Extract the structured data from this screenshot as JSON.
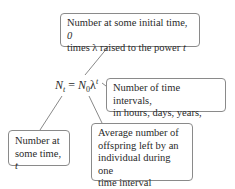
{
  "diagram": {
    "equation": {
      "lhs_var": "N",
      "lhs_sub": "t",
      "equals": "=",
      "rhs_var": "N",
      "rhs_sub": "0",
      "lambda": "λ",
      "exponent": "t"
    },
    "callouts": [
      {
        "id": "initial-number",
        "line1_pre": "Number at some initial time, ",
        "line1_italic": "0",
        "line2_pre": "times λ raised to the power ",
        "line2_italic": "t"
      },
      {
        "id": "time-intervals",
        "line1": "Number of time intervals,",
        "line2": "in hours, days, years, etc."
      },
      {
        "id": "number-at-time-t",
        "line1": "Number at",
        "line2_pre": "some time, ",
        "line2_italic": "t"
      },
      {
        "id": "average-offspring",
        "line1": "Average number of",
        "line2": "offspring left by an",
        "line3": "individual during one",
        "line4": "time interval"
      }
    ],
    "colors": {
      "border": "#8a8a8a",
      "line": "#6a6a6a",
      "text": "#2a2a2a"
    }
  }
}
